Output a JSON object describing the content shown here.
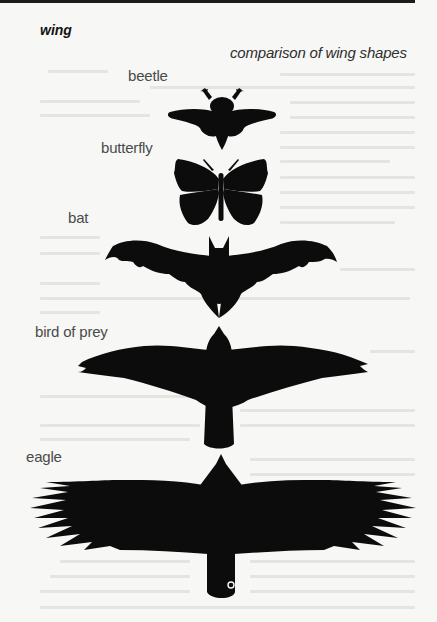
{
  "page": {
    "headword": "wing",
    "figure": {
      "caption": "comparison of wing shapes",
      "silhouettes": [
        {
          "label": "beetle",
          "icon": "beetle-silhouette-icon"
        },
        {
          "label": "butterfly",
          "icon": "butterfly-silhouette-icon"
        },
        {
          "label": "bat",
          "icon": "bat-silhouette-icon"
        },
        {
          "label": "bird of prey",
          "icon": "bird-of-prey-silhouette-icon"
        },
        {
          "label": "eagle",
          "icon": "eagle-silhouette-icon"
        }
      ]
    },
    "colors": {
      "paper": "#f7f7f5",
      "silhouette": "#0c0c0c",
      "rule": "#1b1b1b",
      "label_text": "#4a4a4a"
    }
  }
}
